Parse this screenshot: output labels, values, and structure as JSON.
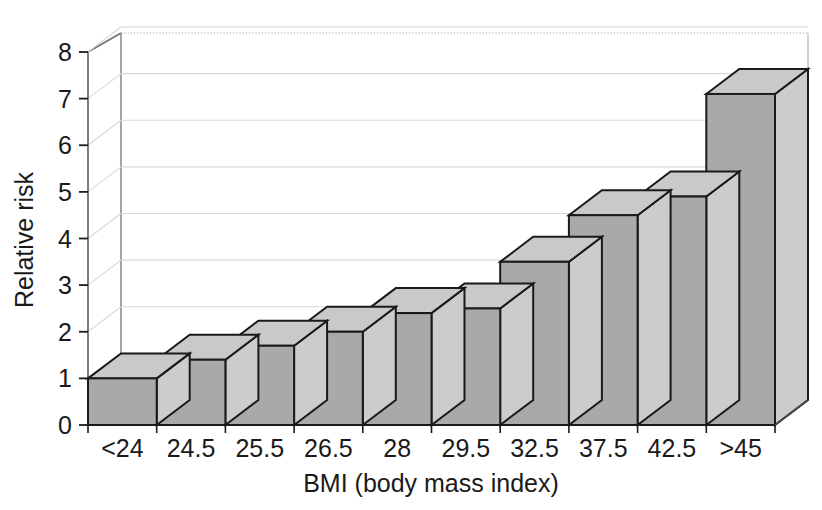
{
  "chart_data": {
    "type": "bar",
    "title": "",
    "subtitle": "",
    "xlabel": "BMI (body mass index)",
    "ylabel": "Relative risk",
    "categories": [
      "<24",
      "24.5",
      "25.5",
      "26.5",
      "28",
      "29.5",
      "32.5",
      "37.5",
      "42.5",
      ">45"
    ],
    "values": [
      1.0,
      1.4,
      1.7,
      2.0,
      2.4,
      2.5,
      3.5,
      4.5,
      4.9,
      7.1
    ],
    "series": [
      {
        "name": "Relative risk",
        "values": [
          1.0,
          1.4,
          1.7,
          2.0,
          2.4,
          2.5,
          3.5,
          4.5,
          4.9,
          7.1
        ]
      }
    ],
    "ylim": [
      0,
      8
    ],
    "ytick_labels": [
      "0",
      "1",
      "2",
      "3",
      "4",
      "5",
      "6",
      "7",
      "8"
    ],
    "ytick_values": [
      0,
      1,
      2,
      3,
      4,
      5,
      6,
      7,
      8
    ],
    "xtick_labels": [
      "<24",
      "24.5",
      "25.5",
      "26.5",
      "28",
      "29.5",
      "32.5",
      "37.5",
      "42.5",
      ">45"
    ],
    "grid": true,
    "grid_axis": "y",
    "legend": false,
    "legend_position": "none",
    "style": "3d-bar",
    "colors": {
      "bar_front": "#a9a9a9",
      "bar_top": "#c9c9c9",
      "bar_side": "#cccccc",
      "bar_outline": "#1a1a1a",
      "grid_line": "#d8d8d8",
      "axis_line": "#555555",
      "background": "#ffffff",
      "text": "#1a1a1a"
    },
    "annotations": []
  }
}
